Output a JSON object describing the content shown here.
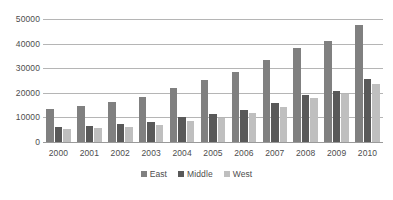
{
  "chart_data": {
    "type": "bar",
    "title": "",
    "subtitle": "",
    "xlabel": "",
    "ylabel": "",
    "grid": true,
    "legend_position": "bottom",
    "ylim": [
      0,
      50000
    ],
    "ytick_labels": [
      "0",
      "10000",
      "20000",
      "30000",
      "40000",
      "50000"
    ],
    "yticks": [
      0,
      10000,
      20000,
      30000,
      40000,
      50000
    ],
    "categories": [
      "2000",
      "2001",
      "2002",
      "2003",
      "2004",
      "2005",
      "2006",
      "2007",
      "2008",
      "2009",
      "2010"
    ],
    "series": [
      {
        "name": "East",
        "color": "#808080",
        "values": [
          13300,
          14500,
          16200,
          18500,
          21800,
          25100,
          28600,
          33400,
          38400,
          41000,
          47400
        ]
      },
      {
        "name": "Middle",
        "color": "#595959",
        "values": [
          6000,
          6700,
          7400,
          8300,
          10000,
          11400,
          13200,
          15900,
          19200,
          20800,
          25500
        ]
      },
      {
        "name": "West",
        "color": "#bfbfbf",
        "values": [
          5200,
          5700,
          6300,
          7100,
          8600,
          9900,
          11900,
          14300,
          17700,
          19500,
          23500
        ]
      }
    ]
  },
  "colors": {
    "east": "#808080",
    "middle": "#595959",
    "west": "#bfbfbf",
    "gridline": "#b5b5b5",
    "text": "#4d4d4d",
    "background": "#ffffff"
  }
}
